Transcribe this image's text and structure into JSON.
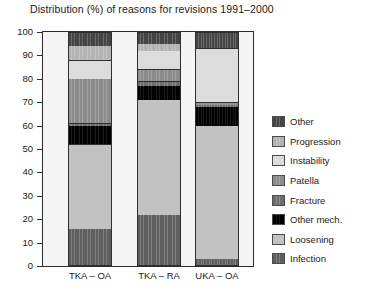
{
  "chart_data": {
    "type": "bar",
    "title": "Distribution (%) of reasons for revisions 1991–2000",
    "xlabel": "",
    "ylabel": "",
    "ylim": [
      0,
      100
    ],
    "yticks": [
      0,
      10,
      20,
      30,
      40,
      50,
      60,
      70,
      80,
      90,
      100
    ],
    "grid": false,
    "stacked": true,
    "legend_position": "right",
    "categories": [
      "TKA – OA",
      "TKA – RA",
      "UKA – OA"
    ],
    "series": [
      {
        "name": "Infection",
        "color": "#5f5f5f",
        "values": [
          16,
          22,
          3
        ]
      },
      {
        "name": "Loosening",
        "color": "#c2c2c2",
        "values": [
          36,
          49,
          57
        ]
      },
      {
        "name": "Other mech.",
        "color": "#000000",
        "values": [
          8,
          6,
          8
        ]
      },
      {
        "name": "Fracture",
        "color": "#6e6e6e",
        "values": [
          1,
          2,
          1
        ]
      },
      {
        "name": "Patella",
        "color": "#8c8c8c",
        "values": [
          19,
          5,
          1
        ]
      },
      {
        "name": "Instability",
        "color": "#dcdcdc",
        "values": [
          8,
          8,
          23
        ]
      },
      {
        "name": "Progression",
        "color": "#b4b4b4",
        "values": [
          6,
          3,
          0
        ]
      },
      {
        "name": "Other",
        "color": "#454545",
        "values": [
          6,
          5,
          7
        ]
      }
    ]
  },
  "legend": {
    "items": [
      {
        "label": "Other",
        "color": "#454545"
      },
      {
        "label": "Progression",
        "color": "#b4b4b4"
      },
      {
        "label": "Instability",
        "color": "#dcdcdc"
      },
      {
        "label": "Patella",
        "color": "#8c8c8c"
      },
      {
        "label": "Fracture",
        "color": "#6e6e6e"
      },
      {
        "label": "Other mech.",
        "color": "#000000"
      },
      {
        "label": "Loosening",
        "color": "#c2c2c2"
      },
      {
        "label": "Infection",
        "color": "#5f5f5f"
      }
    ]
  }
}
